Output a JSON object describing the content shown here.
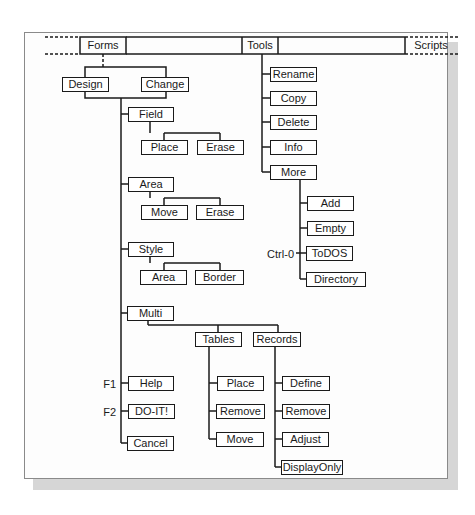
{
  "menubar": {
    "items": [
      {
        "id": "forms",
        "label": "Forms"
      },
      {
        "id": "tools",
        "label": "Tools"
      },
      {
        "id": "scripts",
        "label": "Scripts"
      }
    ]
  },
  "forms": {
    "label": "Forms",
    "children": [
      {
        "label": "Design"
      },
      {
        "label": "Change"
      }
    ],
    "design_menu": [
      {
        "label": "Field",
        "children": [
          {
            "label": "Place"
          },
          {
            "label": "Erase"
          }
        ]
      },
      {
        "label": "Area",
        "children": [
          {
            "label": "Move"
          },
          {
            "label": "Erase"
          }
        ]
      },
      {
        "label": "Style",
        "children": [
          {
            "label": "Area"
          },
          {
            "label": "Border"
          }
        ]
      },
      {
        "label": "Multi",
        "children": [
          {
            "label": "Tables",
            "children": [
              {
                "label": "Place"
              },
              {
                "label": "Remove"
              },
              {
                "label": "Move"
              }
            ]
          },
          {
            "label": "Records",
            "children": [
              {
                "label": "Define"
              },
              {
                "label": "Remove"
              },
              {
                "label": "Adjust"
              },
              {
                "label": "DisplayOnly"
              }
            ]
          }
        ]
      },
      {
        "label": "Help",
        "key": "F1"
      },
      {
        "label": "DO-IT!",
        "key": "F2"
      },
      {
        "label": "Cancel"
      }
    ]
  },
  "tools": {
    "label": "Tools",
    "children": [
      {
        "label": "Rename"
      },
      {
        "label": "Copy"
      },
      {
        "label": "Delete"
      },
      {
        "label": "Info"
      },
      {
        "label": "More",
        "children": [
          {
            "label": "Add"
          },
          {
            "label": "Empty"
          },
          {
            "label": "ToDOS",
            "key": "Ctrl-0"
          },
          {
            "label": "Directory"
          }
        ]
      }
    ]
  },
  "colors": {
    "line": "#1a1a1a",
    "frame_border": "#8a8a8a",
    "shadow": "#d6d6d6",
    "background": "#fdfdfd"
  }
}
